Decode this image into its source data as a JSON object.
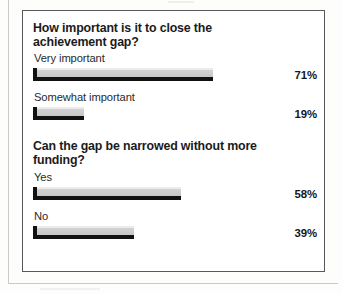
{
  "chart_data": {
    "type": "bar",
    "orientation": "horizontal",
    "title": "",
    "xlabel": "",
    "ylabel": "",
    "xlim": [
      0,
      100
    ],
    "grid": false,
    "legend": null,
    "value_suffix": "%",
    "groups": [
      {
        "question": "How important is it to close the achievement gap?",
        "categories": [
          "Very important",
          "Somewhat important"
        ],
        "values": [
          71,
          19
        ],
        "value_labels": [
          "71%",
          "19%"
        ]
      },
      {
        "question": "Can the gap be narrowed without more funding?",
        "categories": [
          "Yes",
          "No"
        ],
        "values": [
          58,
          39
        ],
        "value_labels": [
          "58%",
          "39%"
        ]
      }
    ]
  },
  "colors": {
    "bar_fill": "#d2d2d2",
    "bar_shadow": "#111111",
    "frame": "#58585a",
    "text": "#1b1b1b",
    "page": "#ffffff"
  },
  "groups": [
    {
      "heading": "How important is it to close the achievement gap?",
      "bars": [
        {
          "label": "Very important",
          "value": 71,
          "value_label": "71%"
        },
        {
          "label": "Somewhat important",
          "value": 19,
          "value_label": "19%"
        }
      ]
    },
    {
      "heading": "Can the gap be narrowed without more funding?",
      "bars": [
        {
          "label": "Yes",
          "value": 58,
          "value_label": "58%"
        },
        {
          "label": "No",
          "value": 39,
          "value_label": "39%"
        }
      ]
    }
  ]
}
